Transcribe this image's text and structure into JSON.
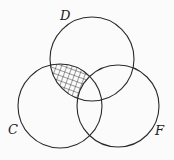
{
  "diagram": {
    "type": "venn",
    "sets": [
      {
        "label": "D",
        "cx": 92,
        "cy": 59,
        "r": 42,
        "label_x": 60,
        "label_y": 20
      },
      {
        "label": "C",
        "cx": 60,
        "cy": 106,
        "r": 42,
        "label_x": 8,
        "label_y": 134
      },
      {
        "label": "F",
        "cx": 118,
        "cy": 106,
        "r": 41,
        "label_x": 155,
        "label_y": 135
      }
    ],
    "shaded_region": "D ∩ C − F",
    "shading_pattern": "crosshatch",
    "colors": {
      "stroke": "#2a2a2a",
      "background": "#fbfbfb"
    }
  }
}
